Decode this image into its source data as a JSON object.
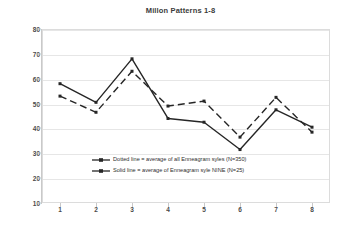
{
  "chart_data": {
    "type": "line",
    "title": "Millon Patterns 1-8",
    "xlabel": "",
    "ylabel": "",
    "x": [
      1,
      2,
      3,
      4,
      5,
      6,
      7,
      8
    ],
    "categories": [
      "1",
      "2",
      "3",
      "4",
      "5",
      "6",
      "7",
      "8"
    ],
    "xtick_labels": [
      "1",
      "2",
      "3",
      "4",
      "5",
      "6",
      "7",
      "8"
    ],
    "ytick_labels": [
      "10",
      "20",
      "30",
      "40",
      "50",
      "60",
      "70",
      "80"
    ],
    "ylim": [
      10,
      80
    ],
    "ytick_step": 10,
    "grid": true,
    "legend_position": "inside-lower-left",
    "series": [
      {
        "name": "Dotted line = average of all Enneagram syles (N=350)",
        "short_name": "all-enneagram-styles",
        "style": "dashed",
        "color": "#262626",
        "n": 350,
        "values": [
          53,
          46.5,
          63,
          49,
          51,
          36.5,
          52.5,
          38.5
        ]
      },
      {
        "name": "Solid line = average of Enneagram syle NINE (N=25)",
        "short_name": "enneagram-style-nine",
        "style": "solid",
        "color": "#262626",
        "n": 25,
        "values": [
          58,
          50.5,
          68,
          44,
          42.5,
          31.5,
          47.5,
          40.5
        ]
      }
    ]
  },
  "legend": {
    "entries": [
      {
        "label": "Dotted line = average of all Enneagram syles (N=350)",
        "marker": "dashed-line-marker"
      },
      {
        "label": "Solid line = average of Enneagram syle NINE (N=25)",
        "marker": "solid-line-marker"
      }
    ]
  },
  "colors": {
    "series": "#262626",
    "grid": "#e6e6e6",
    "axis": "#c9c9c9",
    "text": "#4a4a4a",
    "background": "#ffffff"
  }
}
